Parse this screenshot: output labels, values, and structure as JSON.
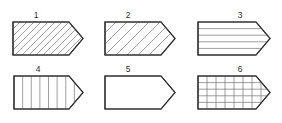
{
  "figure": {
    "title": "",
    "background_color": "#ffffff",
    "outline_color": "#2e2e2e",
    "hatch_color": "#6b6b6b",
    "label_color": "#2b2b2b",
    "rows": 2,
    "columns": 3,
    "shape_kind": "pentagon-arrow-tag",
    "shapes": [
      {
        "label": "1",
        "label_x": 36,
        "label_y": 18,
        "pattern": "diagonal-hatch-dense",
        "pattern_description": "45 degree diagonal lines rising left to right, close spacing",
        "x": 13,
        "y": 22,
        "width": 70,
        "height": 33,
        "tip_inset": 14,
        "hatch_spacing": 7,
        "hatch_angle": 45
      },
      {
        "label": "2",
        "label_x": 128,
        "label_y": 18,
        "pattern": "diagonal-hatch-wide",
        "pattern_description": "45 degree diagonal lines rising left to right, wide spacing",
        "x": 105,
        "y": 22,
        "width": 70,
        "height": 33,
        "tip_inset": 14,
        "hatch_spacing": 11,
        "hatch_angle": 45
      },
      {
        "label": "3",
        "label_x": 240,
        "label_y": 18,
        "pattern": "horizontal-lines",
        "pattern_description": "evenly spaced horizontal lines",
        "x": 198,
        "y": 22,
        "width": 72,
        "height": 33,
        "tip_inset": 14,
        "line_count": 4
      },
      {
        "label": "4",
        "label_x": 38,
        "label_y": 72,
        "pattern": "vertical-lines",
        "pattern_description": "evenly spaced vertical lines",
        "x": 14,
        "y": 76,
        "width": 69,
        "height": 33,
        "tip_inset": 14,
        "line_count": 7
      },
      {
        "label": "5",
        "label_x": 128,
        "label_y": 72,
        "pattern": "blank",
        "pattern_description": "no fill pattern, outline only",
        "x": 105,
        "y": 76,
        "width": 70,
        "height": 33,
        "tip_inset": 14
      },
      {
        "label": "6",
        "label_x": 240,
        "label_y": 72,
        "pattern": "grid",
        "pattern_description": "cross-hatched square grid of horizontal and vertical lines",
        "x": 198,
        "y": 76,
        "width": 72,
        "height": 33,
        "tip_inset": 14,
        "vertical_line_count": 7,
        "horizontal_line_count": 4
      }
    ]
  }
}
